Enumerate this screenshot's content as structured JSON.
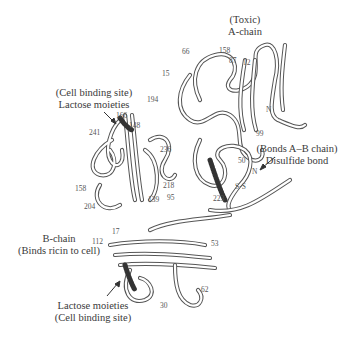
{
  "figure": {
    "a_chain": {
      "line1": "(Toxic)",
      "line2": "A-chain"
    },
    "disulfide": {
      "line1": "(Bonds A–B chain)",
      "line2": "Disulfide bond"
    },
    "cell_binding_top": {
      "line1": "(Cell binding site)",
      "line2": "Lactose moieties"
    },
    "b_chain": {
      "line1": "B-chain",
      "line2": "(Binds ricin to cell)"
    },
    "cell_binding_bottom": {
      "line1": "Lactose moieties",
      "line2": "(Cell binding site)"
    },
    "ss_label": "S-S",
    "residues": {
      "r66": "66",
      "r158a": "158",
      "r87": "87",
      "r12": "12",
      "r15": "15",
      "r194": "194",
      "rN1": "N",
      "r99": "99",
      "r236": "236",
      "r50": "50",
      "rN2": "N",
      "r218": "218",
      "r223": "223",
      "r166": "166",
      "r148": "148",
      "r241": "241",
      "r158b": "158",
      "r204": "204",
      "r139": "139",
      "r95": "95",
      "r17": "17",
      "r112": "112",
      "r53": "53",
      "r62": "62",
      "r30": "30"
    },
    "colors": {
      "ribbon_outline": "#555555",
      "ribbon_fill": "#ffffff",
      "text": "#3a3a3a"
    }
  }
}
